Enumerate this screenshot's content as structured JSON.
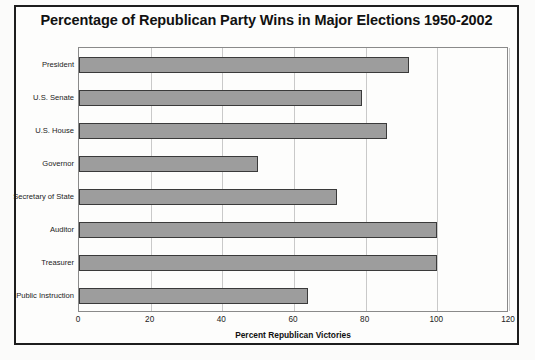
{
  "chart_data": {
    "type": "bar",
    "orientation": "horizontal",
    "title": "Percentage of Republican Party Wins in Major Elections 1950-2002",
    "xlabel": "Percent Republican Victories",
    "ylabel": "",
    "xlim": [
      0,
      120
    ],
    "xticks": [
      0,
      20,
      40,
      60,
      80,
      100,
      120
    ],
    "xtick_labels": [
      "0",
      "20",
      "40",
      "60",
      "80",
      "100",
      "120"
    ],
    "grid": "vertical",
    "legend": "none",
    "categories": [
      "President",
      "U.S. Senate",
      "U.S. House",
      "Governor",
      "Secretary of State",
      "Auditor",
      "Treasurer",
      "Public Instruction"
    ],
    "values": [
      92,
      79,
      86,
      50,
      72,
      100,
      100,
      64
    ],
    "bar_color": "#9d9d9d",
    "bar_edge_color": "#3a3a3a",
    "grid_color": "#c9c9c9",
    "frame_color": "#1d1d1d"
  }
}
